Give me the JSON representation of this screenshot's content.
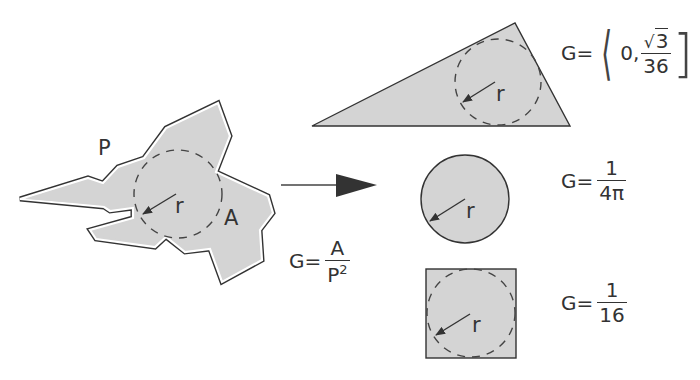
{
  "diagram": {
    "colors": {
      "fill": "#d4d4d4",
      "stroke": "#333333",
      "text": "#333333",
      "background": "#ffffff"
    },
    "irregular_shape": {
      "perimeter_label": "P",
      "area_label": "A",
      "radius_label": "r"
    },
    "transform_arrow": {
      "formula": {
        "lhs": "G=",
        "numerator": "A",
        "denominator_base": "P",
        "denominator_exp": "2"
      }
    },
    "shapes": [
      {
        "name": "triangle",
        "radius_label": "r",
        "formula": {
          "lhs": "G=",
          "open_bracket": "⟨",
          "lower_bound": "0,",
          "upper_numerator_root": "√",
          "upper_numerator_value": "3",
          "upper_denominator": "36",
          "close_bracket": "]"
        }
      },
      {
        "name": "circle",
        "radius_label": "r",
        "formula": {
          "lhs": "G=",
          "numerator": "1",
          "denominator": "4π"
        }
      },
      {
        "name": "square",
        "radius_label": "r",
        "formula": {
          "lhs": "G=",
          "numerator": "1",
          "denominator": "16"
        }
      }
    ]
  }
}
